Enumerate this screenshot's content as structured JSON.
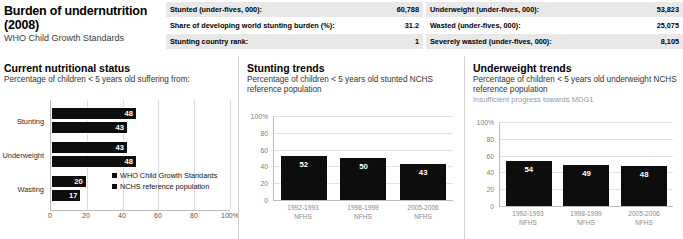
{
  "header": {
    "title": "Burden of undernutrition (2008)",
    "subtitle": "WHO Child Growth Standards",
    "stats_left": [
      {
        "label": "Stunted (under-fives, 000):",
        "value": "60,788"
      },
      {
        "label": "Share of developing world stunting burden (%):",
        "value": "31.2"
      },
      {
        "label": "Stunting country rank:",
        "value": "1"
      }
    ],
    "stats_right": [
      {
        "label": "Underweight (under-fives, 000):",
        "value": "53,823"
      },
      {
        "label": "Wasted (under-fives, 000):",
        "value": "25,075"
      },
      {
        "label": "Severely wasted (under-fives, 000):",
        "value": "8,105"
      }
    ]
  },
  "panel_current": {
    "title": "Current nutritional status",
    "subtitle": "Percentage of children < 5 years old suffering from:",
    "legend": [
      "WHO Child Growth Standards",
      "NCHS reference population"
    ]
  },
  "panel_stunting": {
    "title": "Stunting trends",
    "subtitle": "Percentage of children < 5 years old stunted NCHS reference population"
  },
  "panel_underweight": {
    "title": "Underweight trends",
    "subtitle": "Percentage of children < 5 years old underweight NCHS reference population",
    "note": "Insufficient progress towards MDG1"
  },
  "chart_data": [
    {
      "type": "bar",
      "orientation": "horizontal",
      "title": "Current nutritional status",
      "subtitle": "Percentage of children < 5 years old suffering from:",
      "categories": [
        "Stunting",
        "Underweight",
        "Wasting"
      ],
      "series": [
        {
          "name": "WHO Child Growth Standards",
          "values": [
            48,
            43,
            20
          ]
        },
        {
          "name": "NCHS reference population",
          "values": [
            43,
            48,
            17
          ]
        }
      ],
      "xlabel": "",
      "ylabel": "",
      "xlim": [
        0,
        100
      ],
      "xticks": [
        "0",
        "20",
        "40",
        "60",
        "80",
        "100%"
      ],
      "xtick_values": [
        0,
        20,
        40,
        60,
        80,
        100
      ],
      "grid": true,
      "legend_position": "inside-right"
    },
    {
      "type": "bar",
      "orientation": "vertical",
      "title": "Stunting trends",
      "subtitle": "Percentage of children < 5 years old stunted NCHS reference population",
      "categories": [
        "1992-1993\nNFHS",
        "1998-1999\nNFHS",
        "2005-2006\nNFHS"
      ],
      "category_lines": [
        [
          "1992-1993",
          "NFHS"
        ],
        [
          "1998-1999",
          "NFHS"
        ],
        [
          "2005-2006",
          "NFHS"
        ]
      ],
      "values": [
        52,
        50,
        43
      ],
      "xlabel": "",
      "ylabel": "",
      "ylim": [
        0,
        100
      ],
      "yticks": [
        "100%",
        "80",
        "60",
        "40",
        "20",
        "0"
      ],
      "ytick_values": [
        100,
        80,
        60,
        40,
        20,
        0
      ],
      "grid": true,
      "legend_position": "none"
    },
    {
      "type": "bar",
      "orientation": "vertical",
      "title": "Underweight trends",
      "subtitle": "Percentage of children < 5 years old underweight NCHS reference population",
      "annotation": "Insufficient progress towards MDG1",
      "categories": [
        "1992-1993\nNFHS",
        "1998-1999\nNFHS",
        "2005-2006\nNFHS"
      ],
      "category_lines": [
        [
          "1992-1993",
          "NFHS"
        ],
        [
          "1998-1999",
          "NFHS"
        ],
        [
          "2005-2006",
          "NFHS"
        ]
      ],
      "values": [
        54,
        49,
        48
      ],
      "xlabel": "",
      "ylabel": "",
      "ylim": [
        0,
        100
      ],
      "yticks": [
        "100%",
        "80",
        "60",
        "40",
        "20",
        "0"
      ],
      "ytick_values": [
        100,
        80,
        60,
        40,
        20,
        0
      ],
      "grid": true,
      "legend_position": "none"
    }
  ],
  "colors": {
    "bar": "#0d0d0d",
    "shade_row": "#e8e8e8",
    "grid": "#dcdcdc",
    "muted_text": "#9a9a9a"
  }
}
